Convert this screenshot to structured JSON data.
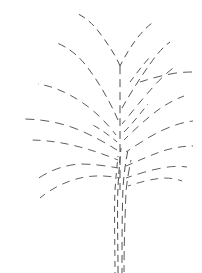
{
  "figure": {
    "kind": "line-drawing",
    "width": 202,
    "height": 273,
    "background_color": "#ffffff",
    "stroke_color": "#5a5a5a",
    "stroke_color_dark": "#434343",
    "stroke_width": 1,
    "dash_style": "dashed"
  },
  "chart_data": {
    "type": "line",
    "xlabel": "",
    "ylabel": "",
    "xlim": [
      0,
      202
    ],
    "ylim": [
      0,
      273
    ],
    "grid": false,
    "legend": false,
    "coordinate_note": "SVG pixel coordinates, y increases downward",
    "series": [
      {
        "name": "trunk-strand-1",
        "group": "trunk",
        "path": "M 118 273 C 118 240 117 210 118 186 C 119 170 120 158 121 148",
        "dasharray": "7 4",
        "dashoffset": 0,
        "color": "#4b4b4b"
      },
      {
        "name": "trunk-strand-2",
        "group": "trunk",
        "path": "M 122 273 C 122 242 122 212 123 188 C 124 172 126 160 128 150",
        "dasharray": "8 5",
        "dashoffset": 3,
        "color": "#515151"
      },
      {
        "name": "trunk-strand-3",
        "group": "trunk",
        "path": "M 115 273 C 115 244 114 214 115 190 C 116 176 117 166 118 156",
        "dasharray": "6 5",
        "dashoffset": 5,
        "color": "#565656"
      },
      {
        "name": "trunk-strand-4",
        "group": "trunk",
        "path": "M 124 272 C 124 246 125 216 126 192 C 127 180 129 170 131 160",
        "dasharray": "9 5",
        "dashoffset": 2,
        "color": "#5c5c5c"
      },
      {
        "name": "central-stem",
        "group": "trunk",
        "path": "M 120 190 C 120 170 120 150 120 130 C 120 110 120 90 120 66",
        "dasharray": "8 5",
        "dashoffset": 1,
        "color": "#4e4e4e"
      },
      {
        "name": "crown-leader-left",
        "group": "crown",
        "path": "M 120 66 C 116 56 108 44 99 32 C 92 23 85 17 76 13",
        "dasharray": "7 5",
        "dashoffset": 0,
        "color": "#4f4f4f"
      },
      {
        "name": "crown-leader-right",
        "group": "crown",
        "path": "M 120 66 C 125 56 131 46 138 37 C 144 30 148 26 152 23",
        "dasharray": "7 5",
        "dashoffset": 2,
        "color": "#525252"
      },
      {
        "name": "branch-upper-left-1",
        "group": "left-branches",
        "path": "M 118 120 C 110 102 100 84 88 68 C 79 56 69 48 57 43",
        "dasharray": "8 5",
        "dashoffset": 0,
        "color": "#565656"
      },
      {
        "name": "branch-upper-left-2",
        "group": "left-branches",
        "path": "M 116 135 C 106 122 94 110 80 101 C 66 92 52 86 38 84",
        "dasharray": "8 6",
        "dashoffset": 3,
        "color": "#5a5a5a"
      },
      {
        "name": "branch-mid-left-1",
        "group": "left-branches",
        "path": "M 117 150 C 104 142 90 134 74 128 C 58 122 40 119 22 119",
        "dasharray": "9 6",
        "dashoffset": 1,
        "color": "#5d5d5d"
      },
      {
        "name": "branch-mid-left-2",
        "group": "left-branches",
        "path": "M 118 160 C 106 155 92 150 76 146 C 60 142 44 140 29 140",
        "dasharray": "8 6",
        "dashoffset": 4,
        "color": "#606060"
      },
      {
        "name": "branch-lower-left-1",
        "group": "left-branches",
        "path": "M 118 168 C 107 166 94 164 80 164 C 64 165 48 171 36 180",
        "dasharray": "9 6",
        "dashoffset": 2,
        "color": "#5f5f5f"
      },
      {
        "name": "branch-lower-left-2",
        "group": "left-branches",
        "path": "M 120 178 C 110 176 98 175 85 177 C 68 180 52 188 40 198",
        "dasharray": "8 6",
        "dashoffset": 5,
        "color": "#636363"
      },
      {
        "name": "branch-upper-right-1",
        "group": "right-branches",
        "path": "M 122 108 C 130 94 140 78 150 64 C 157 54 163 47 170 42",
        "dasharray": "8 5",
        "dashoffset": 0,
        "color": "#545454"
      },
      {
        "name": "branch-upper-right-2",
        "group": "right-branches",
        "path": "M 122 124 C 132 112 143 98 154 86 C 162 77 169 71 176 66",
        "dasharray": "8 6",
        "dashoffset": 3,
        "color": "#585858"
      },
      {
        "name": "branch-right-horizontal",
        "group": "right-branches",
        "path": "M 140 82 C 152 78 164 75 176 73 C 184 72 190 72 195 72",
        "dasharray": "9 6",
        "dashoffset": 1,
        "color": "#5b5b5b"
      },
      {
        "name": "branch-mid-right-1",
        "group": "right-branches",
        "path": "M 124 140 C 134 130 146 119 158 110 C 168 103 176 99 184 96",
        "dasharray": "8 6",
        "dashoffset": 2,
        "color": "#5d5d5d"
      },
      {
        "name": "branch-mid-right-2",
        "group": "right-branches",
        "path": "M 126 152 C 138 144 150 136 163 130 C 174 125 184 122 193 121",
        "dasharray": "9 6",
        "dashoffset": 4,
        "color": "#5f5f5f"
      },
      {
        "name": "branch-lower-right-1",
        "group": "right-branches",
        "path": "M 126 166 C 140 160 153 154 166 150 C 177 147 186 146 193 146",
        "dasharray": "8 6",
        "dashoffset": 1,
        "color": "#606060"
      },
      {
        "name": "branch-lower-right-2",
        "group": "right-branches",
        "path": "M 126 178 C 138 174 150 170 162 168 C 172 166 180 166 187 167",
        "dasharray": "9 6",
        "dashoffset": 3,
        "color": "#636363"
      },
      {
        "name": "branch-lowest-right",
        "group": "right-branches",
        "path": "M 128 186 C 140 182 152 179 163 178 C 171 178 177 179 182 181",
        "dasharray": "8 6",
        "dashoffset": 5,
        "color": "#666666"
      },
      {
        "name": "branch-inner-right-short",
        "group": "right-branches",
        "path": "M 124 132 C 132 124 140 114 148 104",
        "dasharray": "7 5",
        "dashoffset": 0,
        "color": "#5a5a5a"
      },
      {
        "name": "branch-inner-left-short",
        "group": "left-branches",
        "path": "M 117 142 C 110 136 102 130 93 125",
        "dasharray": "7 5",
        "dashoffset": 2,
        "color": "#5c5c5c"
      },
      {
        "name": "branch-crown-inner-right",
        "group": "crown",
        "path": "M 130 82 C 136 74 142 66 149 58",
        "dasharray": "7 5",
        "dashoffset": 1,
        "color": "#575757"
      }
    ]
  }
}
